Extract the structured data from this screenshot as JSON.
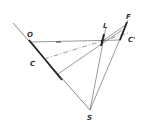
{
  "diagram": {
    "labels": {
      "O": "O",
      "C": "C",
      "L": "L",
      "F": "F",
      "C_prime": "C'",
      "S": "S"
    },
    "colors": {
      "line": "#444444",
      "thick_line": "#222222",
      "background": "#ffffff"
    }
  }
}
